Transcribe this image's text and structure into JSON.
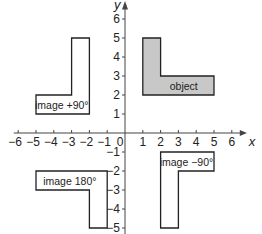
{
  "diagram": {
    "type": "coordinate-rotation",
    "axes": {
      "x_label": "x",
      "y_label": "y",
      "x_ticks": [
        -6,
        -5,
        -4,
        -3,
        -2,
        -1,
        1,
        2,
        3,
        4,
        5,
        6
      ],
      "y_ticks": [
        6,
        5,
        4,
        3,
        2,
        1,
        -1,
        -2,
        -3,
        -4,
        -5
      ],
      "origin_label": "0",
      "x_range": [
        -6,
        6
      ],
      "y_range": [
        -5,
        6
      ]
    },
    "shapes": [
      {
        "id": "object",
        "label": "object",
        "fill": "#c8c8c8",
        "vertices": [
          [
            1,
            2
          ],
          [
            5,
            2
          ],
          [
            5,
            3
          ],
          [
            2,
            3
          ],
          [
            2,
            5
          ],
          [
            1,
            5
          ]
        ],
        "label_pos": [
          3.3,
          2.5
        ]
      },
      {
        "id": "image-plus-90",
        "label": "image +90°",
        "fill": "#ffffff",
        "vertices": [
          [
            -5,
            1
          ],
          [
            -2,
            1
          ],
          [
            -2,
            5
          ],
          [
            -3,
            5
          ],
          [
            -3,
            2
          ],
          [
            -5,
            2
          ]
        ],
        "label_pos": [
          -3.55,
          1.5
        ]
      },
      {
        "id": "image-180",
        "label": "image 180°",
        "fill": "#ffffff",
        "vertices": [
          [
            -5,
            -2
          ],
          [
            -1,
            -2
          ],
          [
            -1,
            -5
          ],
          [
            -2,
            -5
          ],
          [
            -2,
            -3
          ],
          [
            -5,
            -3
          ]
        ],
        "label_pos": [
          -3.1,
          -2.5
        ]
      },
      {
        "id": "image-minus-90",
        "label": "image −90°",
        "fill": "#ffffff",
        "vertices": [
          [
            2,
            -1
          ],
          [
            5,
            -1
          ],
          [
            5,
            -2
          ],
          [
            3,
            -2
          ],
          [
            3,
            -5
          ],
          [
            2,
            -5
          ]
        ],
        "label_pos": [
          3.45,
          -1.5
        ]
      }
    ],
    "colors": {
      "stroke": "#222222",
      "object_fill": "#c8c8c8",
      "axis": "#444444"
    }
  }
}
